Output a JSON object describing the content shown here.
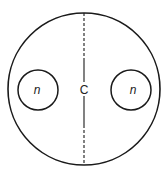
{
  "diagram": {
    "outer_circle": {
      "cx": 84,
      "cy": 89,
      "r": 76
    },
    "left_circle": {
      "cx": 38,
      "cy": 90,
      "r": 20,
      "label": "n"
    },
    "right_circle": {
      "cx": 131,
      "cy": 90,
      "r": 20,
      "label": "n"
    },
    "center_label": "C",
    "stroke_color": "#1a1a1a",
    "axis": {
      "x": 84,
      "dashed_top": [
        13,
        60
      ],
      "solid_top": [
        60,
        82
      ],
      "solid_bottom": [
        96,
        125
      ],
      "dashed_bottom": [
        125,
        165
      ]
    }
  }
}
